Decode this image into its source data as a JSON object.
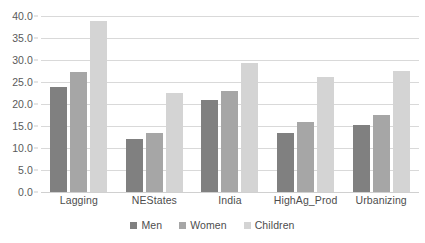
{
  "chart_data": {
    "type": "bar",
    "title": "",
    "xlabel": "",
    "ylabel": "",
    "ylim": [
      0.0,
      40.0
    ],
    "y_tick_step": 5.0,
    "y_ticks": [
      "0.0",
      "5.0",
      "10.0",
      "15.0",
      "20.0",
      "25.0",
      "30.0",
      "35.0",
      "40.0"
    ],
    "grid": "horizontal",
    "legend_position": "bottom",
    "categories": [
      "Lagging",
      "NEStates",
      "India",
      "HighAg_Prod",
      "Urbanizing"
    ],
    "series": [
      {
        "name": "Men",
        "color": "#808080",
        "values": [
          23.9,
          12.1,
          20.8,
          13.5,
          15.3
        ]
      },
      {
        "name": "Women",
        "color": "#a6a6a6",
        "values": [
          27.3,
          13.4,
          22.9,
          15.8,
          17.4
        ]
      },
      {
        "name": "Children",
        "color": "#d4d4d4",
        "values": [
          38.8,
          22.5,
          29.3,
          26.1,
          27.4
        ]
      }
    ]
  },
  "legend": {
    "items": [
      {
        "label": "Men"
      },
      {
        "label": "Women"
      },
      {
        "label": "Children"
      }
    ]
  }
}
